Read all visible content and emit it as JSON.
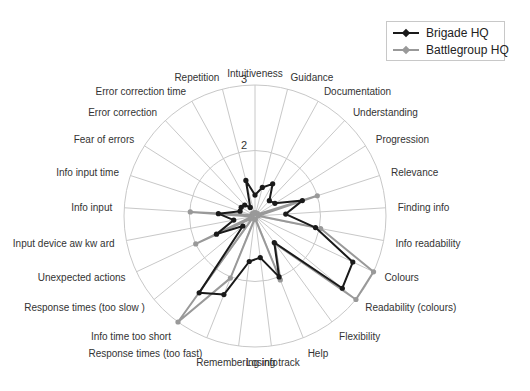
{
  "chart_data": {
    "type": "radar",
    "title": "",
    "radial_range": [
      1,
      3
    ],
    "radial_ticks": [
      "2",
      "3"
    ],
    "grid": true,
    "legend_position": "top-right",
    "categories": [
      "Intuitiveness",
      "Guidance",
      "Documentation",
      "Understanding",
      "Progression",
      "Relevance",
      "Finding info",
      "Info readability",
      "Colours",
      "Readability (colours)",
      "Flexibility",
      "Help",
      "Losing track",
      "Remembering info",
      "Response times (too fast)",
      "Info time too short",
      "Response times (too slow )",
      "Unexpected actions",
      "Input device aw kw ard",
      "Info input",
      "Info input time",
      "Fear of errors",
      "Error correction",
      "Error correction time",
      "Repetition"
    ],
    "series": [
      {
        "name": "Brigade HQ",
        "color": "#1a1a1a",
        "values": [
          1.32,
          1.45,
          1.56,
          1.32,
          1.36,
          1.76,
          1.47,
          1.94,
          2.65,
          2.73,
          1.5,
          2.0,
          1.64,
          1.7,
          2.29,
          2.45,
          1.24,
          1.65,
          1.33,
          1.56,
          1.24,
          1.25,
          1.23,
          1.15,
          1.56
        ]
      },
      {
        "name": "Battlegroup HQ",
        "color": "#999999",
        "values": [
          1.05,
          1.05,
          1.05,
          1.05,
          1.05,
          2.0,
          1.05,
          2.02,
          3.0,
          3.0,
          1.52,
          2.05,
          1.05,
          1.05,
          2.02,
          3.0,
          1.05,
          2.0,
          1.05,
          1.99,
          1.05,
          1.05,
          1.05,
          1.05,
          1.05
        ]
      }
    ]
  },
  "legend": {
    "items": [
      {
        "label": "Brigade HQ",
        "color": "#1a1a1a"
      },
      {
        "label": "Battlegroup HQ",
        "color": "#999999"
      }
    ]
  }
}
